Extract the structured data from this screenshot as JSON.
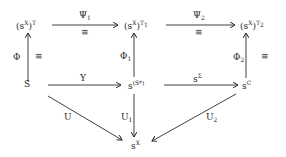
{
  "diagram": {
    "type": "commutative-diagram",
    "nodes": {
      "top_left": {
        "base": "(s",
        "sup": "X",
        "close": ")",
        "exp": "T"
      },
      "top_mid": {
        "base": "(s",
        "sup": "X",
        "close": ")",
        "exp": "T",
        "exp_sub": "1"
      },
      "top_right": {
        "base": "(s",
        "sup": "X",
        "close": ")",
        "exp": "T",
        "exp_sub": "2"
      },
      "mid_left": {
        "text": "S"
      },
      "mid_mid": {
        "base": "s",
        "sup": "(S*)"
      },
      "mid_right": {
        "base": "s",
        "sup": "C"
      },
      "bottom": {
        "base": "s",
        "sup": "X"
      }
    },
    "arrows": {
      "psi1": {
        "name": "Ψ",
        "sub": "1",
        "iso": "≅",
        "from": "top_left",
        "to": "top_mid"
      },
      "psi2": {
        "name": "Ψ",
        "sub": "2",
        "iso": "≅",
        "from": "top_mid",
        "to": "top_right"
      },
      "phi": {
        "name": "Φ",
        "iso": "≅",
        "from": "mid_left",
        "to": "top_left"
      },
      "phi1": {
        "name": "Φ",
        "sub": "1",
        "from": "mid_mid",
        "to": "top_mid"
      },
      "phi2": {
        "name": "Φ",
        "sub": "2",
        "iso": "≅",
        "from": "mid_right",
        "to": "top_right"
      },
      "y": {
        "name": "Y",
        "from": "mid_left",
        "to": "mid_mid"
      },
      "s_sigma": {
        "base": "s",
        "sup": "Σ",
        "from": "mid_mid",
        "to": "mid_right"
      },
      "u": {
        "name": "U",
        "from": "mid_left",
        "to": "bottom"
      },
      "u1": {
        "name": "U",
        "sub": "1",
        "from": "mid_mid",
        "to": "bottom"
      },
      "u2": {
        "name": "U",
        "sub": "2",
        "from": "mid_right",
        "to": "bottom"
      }
    },
    "colors": {
      "ink": "#2a2a2a",
      "background": "#ffffff"
    }
  }
}
